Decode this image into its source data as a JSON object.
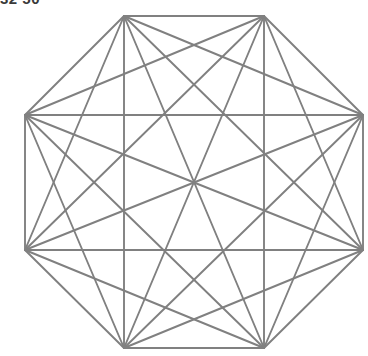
{
  "figure": {
    "title_clipped": "32 50",
    "background_color": "#ffffff",
    "width": 368,
    "height": 356
  },
  "chart_data": {
    "type": "diagram",
    "subtype": "complete-graph",
    "title": "32 50",
    "shape": "regular-octagon",
    "vertex_count": 8,
    "edge_count": 28,
    "perimeter_edge_count": 8,
    "diagonal_count": 20,
    "center": [
      194,
      182
    ],
    "circumradius": 167,
    "rotation_deg": 22.5,
    "stroke_color": "#808080",
    "stroke_width": 1.9,
    "background_color": "#ffffff",
    "grid": false,
    "legend": null,
    "xlabel": "",
    "ylabel": "",
    "vertices": [
      {
        "id": 0,
        "label": "V1",
        "x": 124,
        "y": 16
      },
      {
        "id": 1,
        "label": "V2",
        "x": 264,
        "y": 16
      },
      {
        "id": 2,
        "label": "V3",
        "x": 363,
        "y": 115
      },
      {
        "id": 3,
        "label": "V4",
        "x": 363,
        "y": 250
      },
      {
        "id": 4,
        "label": "V5",
        "x": 264,
        "y": 348
      },
      {
        "id": 5,
        "label": "V6",
        "x": 124,
        "y": 348
      },
      {
        "id": 6,
        "label": "V7",
        "x": 25,
        "y": 250
      },
      {
        "id": 7,
        "label": "V8",
        "x": 25,
        "y": 115
      }
    ],
    "edges": [
      [
        0,
        1
      ],
      [
        0,
        2
      ],
      [
        0,
        3
      ],
      [
        0,
        4
      ],
      [
        0,
        5
      ],
      [
        0,
        6
      ],
      [
        0,
        7
      ],
      [
        1,
        2
      ],
      [
        1,
        3
      ],
      [
        1,
        4
      ],
      [
        1,
        5
      ],
      [
        1,
        6
      ],
      [
        1,
        7
      ],
      [
        2,
        3
      ],
      [
        2,
        4
      ],
      [
        2,
        5
      ],
      [
        2,
        6
      ],
      [
        2,
        7
      ],
      [
        3,
        4
      ],
      [
        3,
        5
      ],
      [
        3,
        6
      ],
      [
        3,
        7
      ],
      [
        4,
        5
      ],
      [
        4,
        6
      ],
      [
        4,
        7
      ],
      [
        5,
        6
      ],
      [
        5,
        7
      ],
      [
        6,
        7
      ]
    ]
  }
}
